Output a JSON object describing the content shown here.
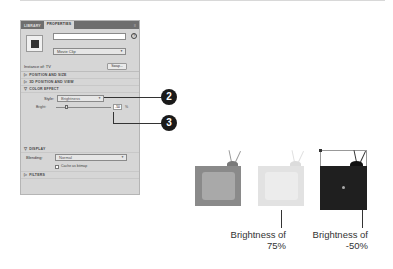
{
  "panel": {
    "tabs": [
      {
        "label": "LIBRARY",
        "active": false
      },
      {
        "label": "PROPERTIES",
        "active": true
      }
    ],
    "menu_icon": "≡",
    "instance_name_placeholder": "",
    "help_icon": "?",
    "symbol_type": "Movie Clip",
    "instance_of_label": "Instance of: TV",
    "swap_button": "Swap...",
    "sections": {
      "position_size": "POSITION AND SIZE",
      "position_view_3d": "3D POSITION AND VIEW",
      "color_effect": "COLOR EFFECT",
      "display": "DISPLAY",
      "filters": "FILTERS"
    },
    "style_label": "Style:",
    "style_value": "Brightness",
    "bright_label": "Bright:",
    "bright_value": "-50",
    "percent": "%",
    "blending_label": "Blending:",
    "blending_value": "Normal",
    "cache_label": "Cache as bitmap"
  },
  "callouts": [
    "2",
    "3"
  ],
  "examples": [
    {
      "name": "original",
      "caption": ""
    },
    {
      "name": "brightness-75",
      "caption_line1": "Brightness of",
      "caption_line2": "75%"
    },
    {
      "name": "brightness-neg50",
      "caption_line1": "Brightness of",
      "caption_line2": "-50%"
    }
  ],
  "colors": {
    "tv_original_body": "#8a8a8a",
    "tv_original_screen": "#a9a9a9",
    "tv_light_body": "#e2e2e2",
    "tv_light_screen": "#ececec",
    "tv_dark_body": "#1f1f1f",
    "badge": "#1a1a1a"
  }
}
